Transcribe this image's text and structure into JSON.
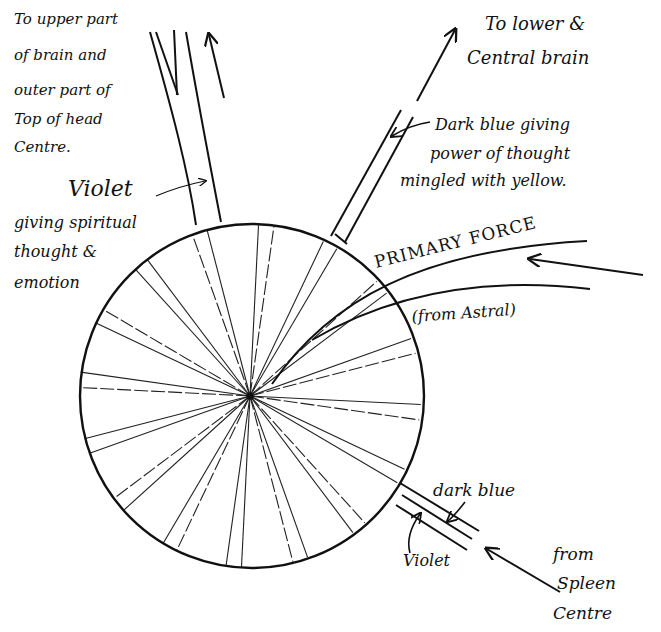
{
  "diagram": {
    "type": "force-centre-diagram",
    "centre_label": "",
    "ray_count": 32,
    "labels": {
      "upper_left": [
        "To upper part",
        "of brain and",
        "outer part of",
        "Top of head",
        "Centre."
      ],
      "upper_right": [
        "To lower &",
        "Central brain"
      ],
      "dark_blue_note": [
        "Dark blue giving",
        "power of thought",
        "mingled with yellow."
      ],
      "violet_note_title": "Violet",
      "violet_note": [
        "giving spiritual",
        "thought &",
        "emotion"
      ],
      "primary_force": "PRIMARY  FORCE",
      "from_astral": "(from Astral)",
      "dark_blue_small": "dark blue",
      "violet_small": "Violet",
      "from_spleen": [
        "from",
        "Spleen",
        "Centre"
      ]
    },
    "streams": [
      {
        "name": "violet-stream",
        "colour_meaning": "Violet",
        "direction": "outward-up"
      },
      {
        "name": "dark-blue-stream",
        "colour_meaning": "Dark blue mingled with yellow",
        "direction": "outward-up-right"
      },
      {
        "name": "primary-force-stream",
        "colour_meaning": "Primary Force",
        "direction": "inward-from-right"
      },
      {
        "name": "spleen-stream",
        "colour_meaning": "dark blue / Violet",
        "direction": "inward-from-lower-right"
      }
    ]
  }
}
